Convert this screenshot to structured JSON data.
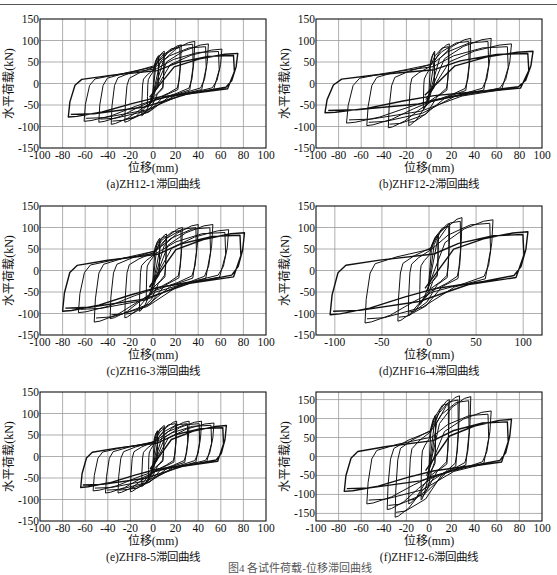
{
  "figure_caption": "图4  各试件荷载-位移滞回曲线",
  "chart_data": [
    {
      "id": "a",
      "type": "line",
      "subtype": "hysteresis",
      "caption": "(a)ZH12-1滞回曲线",
      "xlabel": "位移(mm)",
      "ylabel": "水平荷载(kN)",
      "xlim": [
        -100,
        100
      ],
      "ylim": [
        -150,
        150
      ],
      "xticks": [
        -100,
        -80,
        -60,
        -40,
        -20,
        0,
        20,
        40,
        60,
        80,
        100
      ],
      "yticks": [
        -150,
        -100,
        -50,
        0,
        50,
        100,
        150
      ],
      "grid": true,
      "loops": [
        {
          "d_pos": 5,
          "f_pos": 65,
          "d_neg": -5,
          "f_neg": -55
        },
        {
          "d_pos": 10,
          "f_pos": 75,
          "d_neg": -10,
          "f_neg": -75
        },
        {
          "d_pos": 25,
          "f_pos": 90,
          "d_neg": -25,
          "f_neg": -90
        },
        {
          "d_pos": 37,
          "f_pos": 98,
          "d_neg": -37,
          "f_neg": -95
        },
        {
          "d_pos": 49,
          "f_pos": 92,
          "d_neg": -48,
          "f_neg": -90
        },
        {
          "d_pos": 61,
          "f_pos": 80,
          "d_neg": -61,
          "f_neg": -88
        },
        {
          "d_pos": 75,
          "f_pos": 70,
          "d_neg": -75,
          "f_neg": -78
        }
      ]
    },
    {
      "id": "b",
      "type": "line",
      "subtype": "hysteresis",
      "caption": "(b)ZHF12-2滞回曲线",
      "xlabel": "位移(mm)",
      "ylabel": "水平荷载(kN)",
      "xlim": [
        -100,
        100
      ],
      "ylim": [
        -150,
        150
      ],
      "xticks": [
        -100,
        -80,
        -60,
        -40,
        -20,
        0,
        20,
        40,
        60,
        80,
        100
      ],
      "yticks": [
        -150,
        -100,
        -50,
        0,
        50,
        100,
        150
      ],
      "grid": true,
      "loops": [
        {
          "d_pos": 5,
          "f_pos": 75,
          "d_neg": -5,
          "f_neg": -60
        },
        {
          "d_pos": 18,
          "f_pos": 92,
          "d_neg": -18,
          "f_neg": -98
        },
        {
          "d_pos": 37,
          "f_pos": 105,
          "d_neg": -36,
          "f_neg": -103
        },
        {
          "d_pos": 55,
          "f_pos": 105,
          "d_neg": -55,
          "f_neg": -98
        },
        {
          "d_pos": 73,
          "f_pos": 92,
          "d_neg": -73,
          "f_neg": -92
        },
        {
          "d_pos": 92,
          "f_pos": 75,
          "d_neg": -92,
          "f_neg": -68
        }
      ]
    },
    {
      "id": "c",
      "type": "line",
      "subtype": "hysteresis",
      "caption": "(c)ZH16-3滞回曲线",
      "xlabel": "位移(mm)",
      "ylabel": "水平荷载(kN)",
      "xlim": [
        -100,
        100
      ],
      "ylim": [
        -150,
        150
      ],
      "xticks": [
        -100,
        -80,
        -60,
        -40,
        -20,
        0,
        20,
        40,
        60,
        80,
        100
      ],
      "yticks": [
        -150,
        -100,
        -50,
        0,
        50,
        100,
        150
      ],
      "grid": true,
      "loops": [
        {
          "d_pos": 6,
          "f_pos": 75,
          "d_neg": -6,
          "f_neg": -70
        },
        {
          "d_pos": 12,
          "f_pos": 85,
          "d_neg": -12,
          "f_neg": -95
        },
        {
          "d_pos": 26,
          "f_pos": 100,
          "d_neg": -25,
          "f_neg": -110
        },
        {
          "d_pos": 40,
          "f_pos": 107,
          "d_neg": -38,
          "f_neg": -112
        },
        {
          "d_pos": 53,
          "f_pos": 107,
          "d_neg": -52,
          "f_neg": -120
        },
        {
          "d_pos": 67,
          "f_pos": 95,
          "d_neg": -66,
          "f_neg": -98
        },
        {
          "d_pos": 81,
          "f_pos": 88,
          "d_neg": -80,
          "f_neg": -95
        }
      ]
    },
    {
      "id": "d",
      "type": "line",
      "subtype": "hysteresis",
      "caption": "(d)ZHF16-4滞回曲线",
      "xlabel": "位移(mm)",
      "ylabel": "水平荷载(kN)",
      "xlim": [
        -120,
        120
      ],
      "ylim": [
        -150,
        150
      ],
      "xticks": [
        -100,
        -50,
        0,
        50,
        100
      ],
      "yticks": [
        -150,
        -100,
        -50,
        0,
        50,
        100,
        150
      ],
      "grid": true,
      "loops": [
        {
          "d_pos": 10,
          "f_pos": 85,
          "d_neg": -10,
          "f_neg": -80
        },
        {
          "d_pos": 22,
          "f_pos": 110,
          "d_neg": -22,
          "f_neg": -105
        },
        {
          "d_pos": 35,
          "f_pos": 123,
          "d_neg": -33,
          "f_neg": -118
        },
        {
          "d_pos": 68,
          "f_pos": 118,
          "d_neg": -68,
          "f_neg": -122
        },
        {
          "d_pos": 105,
          "f_pos": 90,
          "d_neg": -105,
          "f_neg": -103
        }
      ]
    },
    {
      "id": "e",
      "type": "line",
      "subtype": "hysteresis",
      "caption": "(e)ZHF8-5滞回曲线",
      "xlabel": "位移(mm)",
      "ylabel": "水平荷载(kN)",
      "xlim": [
        -100,
        100
      ],
      "ylim": [
        -150,
        150
      ],
      "xticks": [
        -100,
        -80,
        -60,
        -40,
        -20,
        0,
        20,
        40,
        60,
        80,
        100
      ],
      "yticks": [
        -150,
        -100,
        -50,
        0,
        50,
        100,
        150
      ],
      "grid": true,
      "loops": [
        {
          "d_pos": 4,
          "f_pos": 60,
          "d_neg": -4,
          "f_neg": -55
        },
        {
          "d_pos": 10,
          "f_pos": 72,
          "d_neg": -10,
          "f_neg": -70
        },
        {
          "d_pos": 21,
          "f_pos": 82,
          "d_neg": -20,
          "f_neg": -82
        },
        {
          "d_pos": 32,
          "f_pos": 82,
          "d_neg": -31,
          "f_neg": -85
        },
        {
          "d_pos": 43,
          "f_pos": 82,
          "d_neg": -42,
          "f_neg": -85
        },
        {
          "d_pos": 54,
          "f_pos": 78,
          "d_neg": -53,
          "f_neg": -80
        },
        {
          "d_pos": 65,
          "f_pos": 72,
          "d_neg": -64,
          "f_neg": -72
        }
      ]
    },
    {
      "id": "f",
      "type": "line",
      "subtype": "hysteresis",
      "caption": "(f)ZHF12-6滞回曲线",
      "xlabel": "位移(mm)",
      "ylabel": "水平荷载(kN)",
      "xlim": [
        -100,
        100
      ],
      "ylim": [
        -170,
        170
      ],
      "xticks": [
        -100,
        -80,
        -60,
        -40,
        -20,
        0,
        20,
        40,
        60,
        80,
        100
      ],
      "yticks": [
        -150,
        -100,
        -50,
        0,
        50,
        100,
        150
      ],
      "grid": true,
      "loops": [
        {
          "d_pos": 6,
          "f_pos": 110,
          "d_neg": -7,
          "f_neg": -115
        },
        {
          "d_pos": 18,
          "f_pos": 150,
          "d_neg": -18,
          "f_neg": -125
        },
        {
          "d_pos": 27,
          "f_pos": 160,
          "d_neg": -30,
          "f_neg": -160
        },
        {
          "d_pos": 37,
          "f_pos": 158,
          "d_neg": -37,
          "f_neg": -140
        },
        {
          "d_pos": 55,
          "f_pos": 120,
          "d_neg": -55,
          "f_neg": -125
        },
        {
          "d_pos": 73,
          "f_pos": 98,
          "d_neg": -75,
          "f_neg": -92
        }
      ]
    }
  ]
}
